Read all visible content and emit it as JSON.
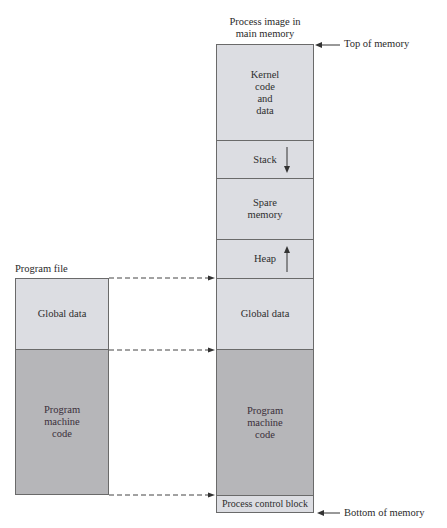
{
  "title": "Process image in main memory",
  "colors": {
    "light_region": "#dcdde2",
    "dark_region": "#b6b6b9",
    "border": "#6a6a6a",
    "text": "#2a2a2a"
  },
  "memory": {
    "caption": "Process image in\nmain memory",
    "top_label": "Top of memory",
    "bottom_label": "Bottom of memory",
    "segments": [
      {
        "id": "kernel",
        "label": "Kernel\ncode\nand\ndata",
        "shade": "light"
      },
      {
        "id": "stack",
        "label": "Stack",
        "shade": "light",
        "growth": "down"
      },
      {
        "id": "spare",
        "label": "Spare\nmemory",
        "shade": "light"
      },
      {
        "id": "heap",
        "label": "Heap",
        "shade": "light",
        "growth": "up"
      },
      {
        "id": "global",
        "label": "Global data",
        "shade": "light"
      },
      {
        "id": "program",
        "label": "Program\nmachine\ncode",
        "shade": "dark"
      },
      {
        "id": "pcb",
        "label": "Process control block",
        "shade": "light"
      }
    ]
  },
  "program_file": {
    "caption": "Program file",
    "segments": [
      {
        "id": "global",
        "label": "Global data",
        "shade": "light"
      },
      {
        "id": "program",
        "label": "Program\nmachine\ncode",
        "shade": "dark"
      }
    ]
  },
  "mappings": [
    {
      "from": "program_file.top",
      "to": "memory.global.top",
      "style": "dashed-arrow"
    },
    {
      "from": "program_file.global_program_boundary",
      "to": "memory.program.top",
      "style": "dashed-arrow"
    },
    {
      "from": "program_file.bottom",
      "to": "memory.pcb.top",
      "style": "dashed-arrow"
    }
  ],
  "icons": {
    "stack_arrow": "arrow-down-icon",
    "heap_arrow": "arrow-up-icon",
    "top_pointer": "arrow-left-icon",
    "bottom_pointer": "arrow-left-icon"
  }
}
